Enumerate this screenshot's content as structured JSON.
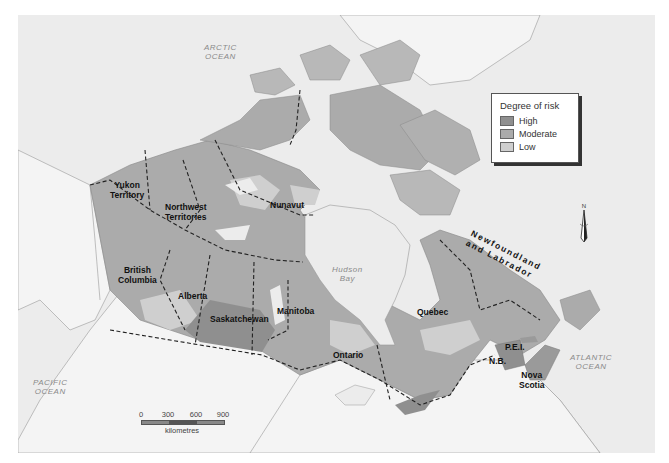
{
  "map": {
    "title": "Degree of risk map of Canada",
    "legend": {
      "title": "Degree of risk",
      "items": [
        {
          "label": "High",
          "color": "#8f8f8f"
        },
        {
          "label": "Moderate",
          "color": "#ababab"
        },
        {
          "label": "Low",
          "color": "#cfcfcf"
        }
      ]
    },
    "regions": {
      "yukon": "Yukon\nTerritory",
      "yukon_l1": "Yukon",
      "yukon_l2": "Territory",
      "nwt_l1": "Northwest",
      "nwt_l2": "Territories",
      "nunavut": "Nunavut",
      "bc_l1": "British",
      "bc_l2": "Columbia",
      "alberta": "Alberta",
      "saskatchewan": "Saskatchewan",
      "manitoba": "Manitoba",
      "ontario": "Ontario",
      "quebec": "Quebec",
      "nl_l1": "Newfoundland",
      "nl_l2": "and Labrador",
      "nb": "N.B.",
      "pei": "P.E.I.",
      "ns_l1": "Nova",
      "ns_l2": "Scotia"
    },
    "water": {
      "arctic_l1": "ARCTIC",
      "arctic_l2": "OCEAN",
      "pacific_l1": "PACIFIC",
      "pacific_l2": "OCEAN",
      "atlantic_l1": "ATLANTIC",
      "atlantic_l2": "OCEAN",
      "hudson_l1": "Hudson",
      "hudson_l2": "Bay"
    },
    "scale": {
      "ticks": [
        "0",
        "300",
        "600",
        "900"
      ],
      "unit": "kilometres"
    },
    "north_label": "N",
    "colors": {
      "ocean": "#ececec",
      "outside_land": "#f4f4f4",
      "high": "#8f8f8f",
      "moderate": "#ababab",
      "low": "#cfcfcf",
      "border": "#222222"
    }
  }
}
